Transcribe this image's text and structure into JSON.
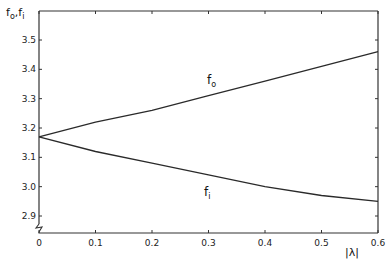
{
  "chart_data": {
    "type": "line",
    "title": "",
    "xlabel": "|λ|",
    "ylabel": "f_o, f_i",
    "ylabel_parts": {
      "main1": "f",
      "sub1": "o",
      "sep": ",",
      "main2": "f",
      "sub2": "i"
    },
    "x": [
      0,
      0.1,
      0.2,
      0.3,
      0.4,
      0.5,
      0.6
    ],
    "series": [
      {
        "name": "f_o",
        "label_main": "f",
        "label_sub": "o",
        "values": [
          3.17,
          3.22,
          3.26,
          3.31,
          3.36,
          3.41,
          3.46
        ]
      },
      {
        "name": "f_i",
        "label_main": "f",
        "label_sub": "i",
        "values": [
          3.17,
          3.12,
          3.08,
          3.04,
          3.0,
          2.97,
          2.95
        ]
      }
    ],
    "xlim": [
      0,
      0.6
    ],
    "ylim": [
      2.85,
      3.6
    ],
    "xticks": [
      "0",
      "0.1",
      "0.2",
      "0.3",
      "0.4",
      "0.5",
      "0.6"
    ],
    "yticks": [
      "2.9",
      "3.0",
      "3.1",
      "3.2",
      "3.3",
      "3.4",
      "3.5"
    ],
    "y_axis_break": true,
    "grid": false,
    "legend": "inline labels"
  },
  "colors": {
    "line": "#2a2a2a",
    "axis": "#333333",
    "background": "#ffffff"
  }
}
